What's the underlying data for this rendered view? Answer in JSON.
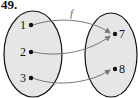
{
  "problem_number": "49.",
  "function_label": "f",
  "domain": {
    "elements": [
      "1",
      "2",
      "3"
    ]
  },
  "codomain": {
    "elements": [
      "7",
      "8"
    ]
  },
  "mappings": [
    {
      "from": "1",
      "to": "7"
    },
    {
      "from": "2",
      "to": "7"
    },
    {
      "from": "3",
      "to": "8"
    }
  ],
  "colors": {
    "set_fill": "#e6e6e6",
    "stroke": "#111111",
    "arrow": "#777777"
  }
}
